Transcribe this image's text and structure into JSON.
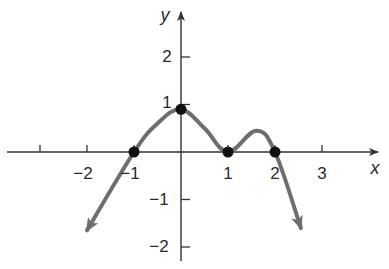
{
  "chart_data": {
    "type": "line",
    "title": "",
    "xlabel": "x",
    "ylabel": "y",
    "xlim": [
      -3.5,
      4.2
    ],
    "ylim": [
      -2.3,
      3
    ],
    "grid": false,
    "legend": null,
    "x_ticks": [
      -3,
      -2,
      -1,
      1,
      2,
      3
    ],
    "x_tick_labels": [
      "",
      "−2",
      "−1",
      "1",
      "2",
      "3"
    ],
    "y_ticks": [
      2,
      1,
      -1,
      -2
    ],
    "y_tick_labels": [
      "2",
      "1",
      "−1",
      "−2"
    ],
    "curve": {
      "description": "Polynomial-like curve with arrows at both ends pointing downward",
      "points": [
        {
          "x": -2.0,
          "y": -1.65
        },
        {
          "x": -1.0,
          "y": 0
        },
        {
          "x": -0.5,
          "y": 0.6
        },
        {
          "x": 0.0,
          "y": 0.9
        },
        {
          "x": 0.5,
          "y": 0.5
        },
        {
          "x": 1.0,
          "y": 0
        },
        {
          "x": 1.6,
          "y": 0.45
        },
        {
          "x": 2.0,
          "y": 0
        },
        {
          "x": 2.55,
          "y": -1.6
        }
      ],
      "end_arrows": true,
      "color": "#6e6e6e"
    },
    "marked_points": [
      {
        "x": -1,
        "y": 0
      },
      {
        "x": 0,
        "y": 0.9
      },
      {
        "x": 1,
        "y": 0
      },
      {
        "x": 2,
        "y": 0
      }
    ],
    "colors": {
      "axis": "#333333",
      "curve": "#6e6e6e",
      "points": "#111111"
    }
  }
}
